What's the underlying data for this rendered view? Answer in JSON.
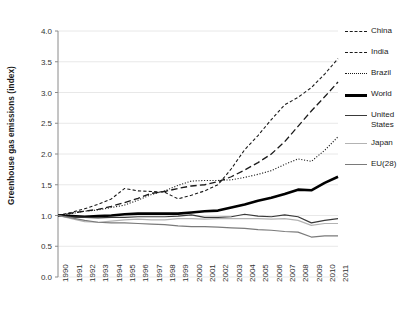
{
  "chart_data": {
    "type": "line",
    "title": "",
    "xlabel": "",
    "ylabel": "Greenhouse gas emissions (index)",
    "ylim": [
      0.0,
      4.0
    ],
    "ytick_labels": [
      "0.0",
      "0.5",
      "1.0",
      "1.5",
      "2.0",
      "2.5",
      "3.0",
      "3.5",
      "4.0"
    ],
    "ytick_values": [
      0.0,
      0.5,
      1.0,
      1.5,
      2.0,
      2.5,
      3.0,
      3.5,
      4.0
    ],
    "grid": "horizontal",
    "legend_position": "right",
    "x": [
      1990,
      1991,
      1992,
      1993,
      1994,
      1995,
      1996,
      1997,
      1998,
      1999,
      2000,
      2001,
      2002,
      2003,
      2004,
      2005,
      2006,
      2007,
      2008,
      2009,
      2010,
      2011
    ],
    "categories": [
      "1990",
      "1991",
      "1992",
      "1993",
      "1994",
      "1995",
      "1996",
      "1997",
      "1998",
      "1999",
      "2000",
      "2001",
      "2002",
      "2003",
      "2004",
      "2005",
      "2006",
      "2007",
      "2008",
      "2009",
      "2010",
      "2011"
    ],
    "series": [
      {
        "name": "China",
        "style": "dashed",
        "color": "#1a1a1a",
        "width": 1.1,
        "values": [
          1.0,
          1.05,
          1.11,
          1.18,
          1.27,
          1.44,
          1.4,
          1.39,
          1.38,
          1.27,
          1.33,
          1.4,
          1.5,
          1.76,
          2.07,
          2.3,
          2.56,
          2.8,
          2.92,
          3.08,
          3.3,
          3.55
        ]
      },
      {
        "name": "India",
        "style": "long-dashed",
        "color": "#1a1a1a",
        "width": 1.3,
        "values": [
          1.0,
          1.04,
          1.07,
          1.1,
          1.15,
          1.21,
          1.28,
          1.36,
          1.39,
          1.44,
          1.48,
          1.5,
          1.55,
          1.63,
          1.74,
          1.86,
          2.0,
          2.2,
          2.45,
          2.7,
          2.93,
          3.17
        ]
      },
      {
        "name": "Brazil",
        "style": "dotted",
        "color": "#1a1a1a",
        "width": 1.1,
        "values": [
          1.0,
          1.03,
          1.07,
          1.09,
          1.13,
          1.17,
          1.25,
          1.34,
          1.4,
          1.49,
          1.56,
          1.57,
          1.57,
          1.58,
          1.62,
          1.67,
          1.73,
          1.83,
          1.92,
          1.88,
          2.06,
          2.28
        ]
      },
      {
        "name": "World",
        "style": "solid",
        "color": "#000000",
        "width": 2.6,
        "values": [
          1.0,
          0.99,
          0.98,
          0.99,
          1.0,
          1.02,
          1.03,
          1.03,
          1.03,
          1.03,
          1.05,
          1.07,
          1.08,
          1.13,
          1.18,
          1.24,
          1.29,
          1.35,
          1.42,
          1.41,
          1.53,
          1.63
        ]
      },
      {
        "name": "United States",
        "style": "solid",
        "color": "#3a3a3a",
        "width": 1.2,
        "values": [
          1.0,
          0.98,
          0.97,
          0.96,
          0.97,
          0.97,
          0.98,
          0.98,
          0.98,
          0.99,
          1.01,
          0.97,
          0.97,
          0.98,
          1.02,
          0.99,
          0.98,
          1.01,
          0.98,
          0.88,
          0.92,
          0.95
        ]
      },
      {
        "name": "Japan",
        "style": "solid",
        "color": "#b3b3b3",
        "width": 1.2,
        "values": [
          1.0,
          0.95,
          0.9,
          0.89,
          0.91,
          0.93,
          0.94,
          0.93,
          0.93,
          0.95,
          0.95,
          0.94,
          0.95,
          0.95,
          0.95,
          0.95,
          0.94,
          0.95,
          0.92,
          0.84,
          0.87,
          0.87
        ]
      },
      {
        "name": "EU(28)",
        "style": "solid",
        "color": "#7a7a7a",
        "width": 1.2,
        "values": [
          1.0,
          0.96,
          0.92,
          0.89,
          0.88,
          0.88,
          0.87,
          0.86,
          0.85,
          0.83,
          0.82,
          0.82,
          0.81,
          0.8,
          0.79,
          0.77,
          0.76,
          0.74,
          0.73,
          0.65,
          0.67,
          0.67
        ]
      }
    ]
  }
}
